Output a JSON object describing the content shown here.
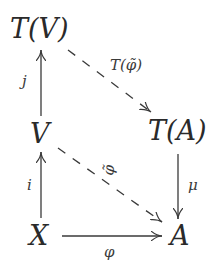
{
  "diagram": {
    "type": "commutative-diagram",
    "nodes": {
      "TV": "T(V)",
      "V": "V",
      "X": "X",
      "TA": "T(A)",
      "A": "A"
    },
    "edges": {
      "j": {
        "label": "j",
        "from": "V",
        "to": "T(V)",
        "style": "solid"
      },
      "i": {
        "label": "i",
        "from": "X",
        "to": "V",
        "style": "solid"
      },
      "phi": {
        "label": "φ",
        "from": "X",
        "to": "A",
        "style": "solid"
      },
      "mu": {
        "label": "μ",
        "from": "T(A)",
        "to": "A",
        "style": "solid"
      },
      "T_phi_tilde": {
        "label": "T(φ̃)",
        "from": "T(V)",
        "to": "T(A)",
        "style": "dashed"
      },
      "phi_tilde": {
        "label": "φ̃",
        "from": "V",
        "to": "A",
        "style": "dashed"
      }
    },
    "colors": {
      "ink": "#2a2a2a",
      "background": "#ffffff"
    }
  }
}
